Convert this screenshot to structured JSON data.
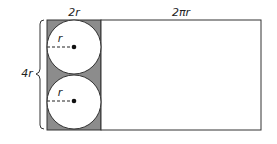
{
  "diagram": {
    "labels": {
      "shaded_width": "2r",
      "right_width": "2πr",
      "height": "4r",
      "top_radius": "r",
      "bottom_radius": "r"
    },
    "colors": {
      "shaded": "#8c8c8c",
      "outline": "#333333",
      "circle_fill": "#ffffff"
    }
  }
}
